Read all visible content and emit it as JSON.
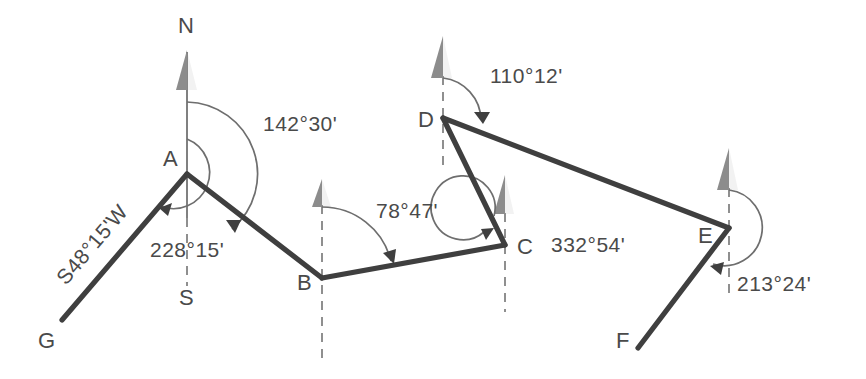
{
  "diagram": {
    "colors": {
      "traverse_line": "#3f3f3f",
      "meridian": "#8a8a8a",
      "arc": "#6e6e6e",
      "north_arrow": "#8c8c8c",
      "text": "#4a4a4a",
      "background": "#ffffff"
    },
    "station_labels": {
      "A": "A",
      "B": "B",
      "C": "C",
      "D": "D",
      "E": "E",
      "F": "F",
      "G": "G",
      "N": "N",
      "S": "S"
    },
    "angle_labels": {
      "at_a_back": "228°15'",
      "at_a_fore": "142°30'",
      "at_b": "78°47'",
      "at_c": "332°54'",
      "at_d": "110°12'",
      "at_e": "213°24'"
    },
    "bearing_labels": {
      "ga": "S48°15'W"
    },
    "stations": [
      {
        "name": "A",
        "x": 187,
        "y": 174
      },
      {
        "name": "B",
        "x": 322,
        "y": 278
      },
      {
        "name": "C",
        "x": 505,
        "y": 245
      },
      {
        "name": "D",
        "x": 443,
        "y": 118
      },
      {
        "name": "E",
        "x": 729,
        "y": 228
      },
      {
        "name": "F",
        "x": 638,
        "y": 348
      },
      {
        "name": "G",
        "x": 62,
        "y": 320
      }
    ],
    "segments": [
      {
        "from": "G",
        "to": "A"
      },
      {
        "from": "A",
        "to": "B"
      },
      {
        "from": "B",
        "to": "C"
      },
      {
        "from": "C",
        "to": "D"
      },
      {
        "from": "D",
        "to": "E"
      },
      {
        "from": "E",
        "to": "F"
      }
    ]
  }
}
